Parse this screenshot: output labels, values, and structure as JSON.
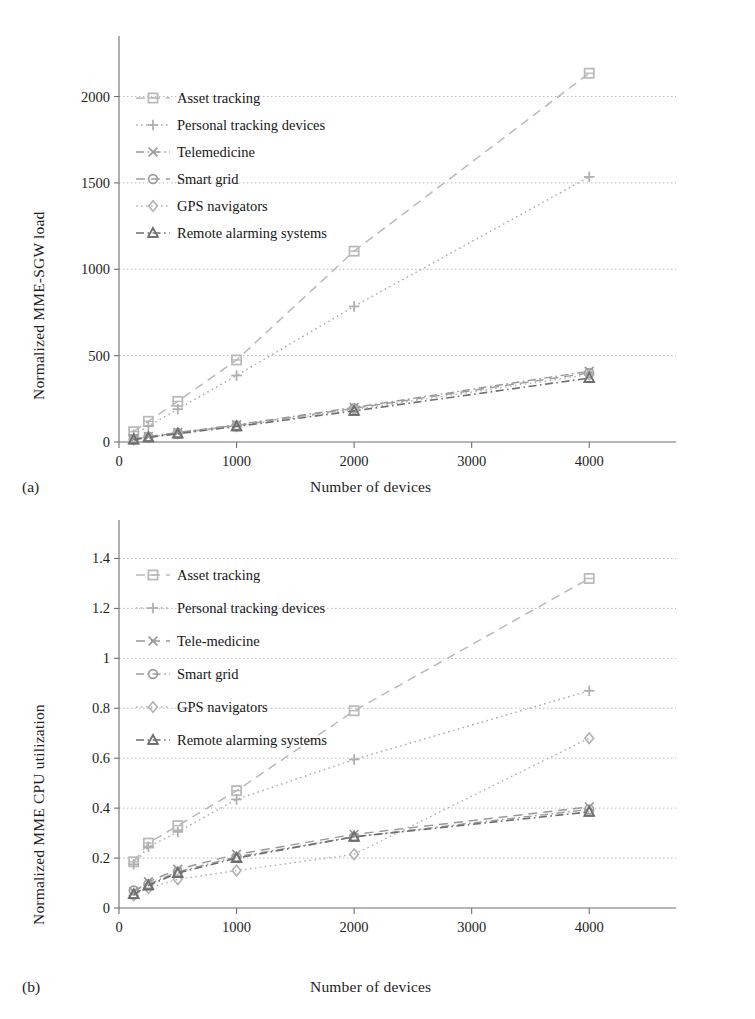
{
  "figure": {
    "panels": [
      {
        "tag": "(a)",
        "xlabel": "Number of devices",
        "ylabel": "Normalized MME-SGW load"
      },
      {
        "tag": "(b)",
        "xlabel": "Number of devices",
        "ylabel": "Normalized MME CPU utilization"
      }
    ]
  },
  "chart_data": [
    {
      "type": "line",
      "panel": "(a)",
      "title": "",
      "xlabel": "Number of devices",
      "ylabel": "Normalized MME-SGW load",
      "x": [
        125,
        250,
        500,
        1000,
        2000,
        4000
      ],
      "xlim": [
        0,
        4500
      ],
      "ylim": [
        0,
        2200
      ],
      "xticks": [
        0,
        1000,
        2000,
        3000,
        4000
      ],
      "xticklabels": [
        "0",
        "1000",
        "2000",
        "3000",
        "4000"
      ],
      "yticks": [
        0,
        500,
        1000,
        1500,
        2000
      ],
      "yticklabels": [
        "0",
        "500",
        "1000",
        "1500",
        "2000"
      ],
      "grid": "horizontal",
      "legend_position": "upper-left-inside",
      "series": [
        {
          "name": "Asset tracking",
          "marker": "square",
          "dash": "dashed",
          "values": [
            60,
            120,
            235,
            475,
            1105,
            2135
          ]
        },
        {
          "name": "Personal tracking devices",
          "marker": "plus",
          "dash": "dotted",
          "values": [
            42,
            92,
            190,
            385,
            785,
            1535
          ]
        },
        {
          "name": "Telemedicine",
          "marker": "cross",
          "dash": "dash-dot",
          "values": [
            18,
            32,
            55,
            100,
            200,
            410
          ]
        },
        {
          "name": "Smart grid",
          "marker": "circle",
          "dash": "dashed",
          "values": [
            16,
            30,
            52,
            96,
            195,
            400
          ]
        },
        {
          "name": "GPS navigators",
          "marker": "diamond",
          "dash": "dotted",
          "values": [
            15,
            28,
            50,
            92,
            188,
            390
          ]
        },
        {
          "name": "Remote alarming systems",
          "marker": "triangle",
          "dash": "dash-dot",
          "values": [
            14,
            26,
            48,
            90,
            180,
            370
          ]
        }
      ]
    },
    {
      "type": "line",
      "panel": "(b)",
      "title": "",
      "xlabel": "Number of devices",
      "ylabel": "Normalized MME CPU utilization",
      "x": [
        125,
        250,
        500,
        1000,
        2000,
        4000
      ],
      "xlim": [
        0,
        4500
      ],
      "ylim": [
        0,
        1.45
      ],
      "xticks": [
        0,
        1000,
        2000,
        3000,
        4000
      ],
      "xticklabels": [
        "0",
        "1000",
        "2000",
        "3000",
        "4000"
      ],
      "yticks": [
        0,
        0.2,
        0.4,
        0.6,
        0.8,
        1,
        1.2,
        1.4
      ],
      "yticklabels": [
        "0",
        "0.2",
        "0.4",
        "0.6",
        "0.8",
        "1",
        "1.2",
        "1.4"
      ],
      "grid": "horizontal",
      "legend_position": "upper-left-inside",
      "series": [
        {
          "name": "Asset tracking",
          "marker": "square",
          "dash": "dashed",
          "values": [
            0.185,
            0.26,
            0.33,
            0.47,
            0.79,
            1.32
          ]
        },
        {
          "name": "Personal tracking devices",
          "marker": "plus",
          "dash": "dotted",
          "values": [
            0.175,
            0.245,
            0.305,
            0.435,
            0.595,
            0.87
          ]
        },
        {
          "name": "Tele-medicine",
          "marker": "cross",
          "dash": "dashed",
          "values": [
            0.065,
            0.105,
            0.155,
            0.215,
            0.295,
            0.405
          ]
        },
        {
          "name": "Smart grid",
          "marker": "circle",
          "dash": "dash-dot",
          "values": [
            0.07,
            0.095,
            0.145,
            0.205,
            0.285,
            0.395
          ]
        },
        {
          "name": "GPS navigators",
          "marker": "diamond",
          "dash": "dotted",
          "values": [
            0.05,
            0.08,
            0.115,
            0.15,
            0.215,
            0.68
          ]
        },
        {
          "name": "Remote alarming systems",
          "marker": "triangle",
          "dash": "dash-dot",
          "values": [
            0.055,
            0.09,
            0.14,
            0.2,
            0.285,
            0.385
          ]
        }
      ]
    }
  ],
  "colors": {
    "axis": "#6f6f6f",
    "grid": "#9aa3ad",
    "text": "#1d1d1d",
    "series_light": "#b4b4b4",
    "series_mid": "#9a9a9a",
    "series_dark": "#6a6a6a"
  }
}
